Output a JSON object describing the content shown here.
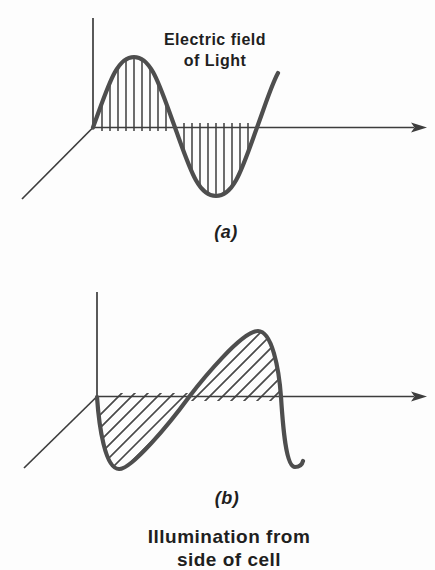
{
  "figure": {
    "background": "#fdfdfd",
    "colors": {
      "axis": "#3d3d3d",
      "curve": "#4e4e4e",
      "hatch": "#494949",
      "text": "#1f1f1f"
    },
    "panel_a": {
      "title_line1": "Electric field",
      "title_line2": "of Light",
      "label": "(a)"
    },
    "panel_b": {
      "label": "(b)",
      "caption_line1": "Illumination from",
      "caption_line2": "side of cell"
    }
  }
}
